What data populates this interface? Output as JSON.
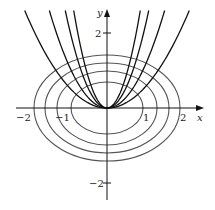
{
  "figure": {
    "axes": {
      "x_label": "x",
      "y_label": "y",
      "x_ticks": [
        {
          "value": -2,
          "label": "−2"
        },
        {
          "value": -1,
          "label": "−1"
        },
        {
          "value": 1,
          "label": "1"
        },
        {
          "value": 2,
          "label": "2"
        }
      ],
      "y_ticks": [
        {
          "value": 2,
          "label": "2"
        },
        {
          "value": -2,
          "label": "−2"
        }
      ]
    },
    "curves": {
      "ellipses": {
        "family": "x^2 + 2y^2 = c",
        "semi_axes_x": [
          0.96,
          1.33,
          1.65,
          1.95
        ],
        "color": "#555555"
      },
      "parabolas": {
        "family": "y = kx^2",
        "k": [
          0.54,
          1.1,
          2.1,
          3.3
        ],
        "color": "#111111"
      }
    }
  }
}
